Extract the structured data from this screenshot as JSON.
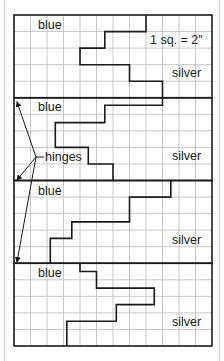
{
  "diagram": {
    "scale_label": "1 sq. = 2″",
    "hinges_label": "hinges",
    "grid": {
      "columns": 12,
      "rows": 20,
      "rows_per_panel": 5,
      "origin_x": 14,
      "origin_y": 15,
      "cell_w": 16.5,
      "cell_h": 16.55
    },
    "colors": {
      "grid": "#c8c8c8",
      "outline": "#1a1a1a",
      "frame": "#d4d4d4"
    },
    "panels": [
      {
        "top_label": "blue",
        "bottom_label": "silver",
        "path": [
          [
            8,
            0
          ],
          [
            8,
            1
          ],
          [
            5.5,
            1
          ],
          [
            5.5,
            2
          ],
          [
            4,
            2
          ],
          [
            4,
            3
          ],
          [
            7,
            3
          ],
          [
            7,
            4
          ],
          [
            9,
            4
          ],
          [
            9,
            5
          ]
        ]
      },
      {
        "top_label": "blue",
        "bottom_label": "silver",
        "path": [
          [
            9,
            5
          ],
          [
            9,
            5.45
          ],
          [
            5.5,
            5.45
          ],
          [
            5.5,
            6.5
          ],
          [
            2.5,
            6.5
          ],
          [
            2.5,
            8
          ],
          [
            4.5,
            8
          ],
          [
            4.5,
            9
          ],
          [
            6,
            9
          ],
          [
            6,
            10
          ]
        ]
      },
      {
        "top_label": "blue",
        "bottom_label": "silver",
        "path": [
          [
            9.5,
            10
          ],
          [
            9.5,
            11
          ],
          [
            7,
            11
          ],
          [
            7,
            12.5
          ],
          [
            3.5,
            12.5
          ],
          [
            3.5,
            13.5
          ],
          [
            2.2,
            13.5
          ],
          [
            2.2,
            15
          ]
        ]
      },
      {
        "top_label": "blue",
        "bottom_label": "silver",
        "path": [
          [
            4,
            15
          ],
          [
            4,
            15.5
          ],
          [
            5,
            15.5
          ],
          [
            5,
            16.5
          ],
          [
            8.5,
            16.5
          ],
          [
            8.5,
            17.5
          ],
          [
            6.2,
            17.5
          ],
          [
            6.2,
            18.5
          ],
          [
            3.2,
            18.5
          ],
          [
            3.2,
            20
          ]
        ]
      }
    ],
    "hinge_arrows": [
      {
        "from": [
          36,
          157
        ],
        "to": [
          17,
          102
        ]
      },
      {
        "from": [
          36,
          157
        ],
        "to": [
          17,
          180
        ]
      },
      {
        "from": [
          36,
          157
        ],
        "to": [
          17,
          262
        ]
      }
    ]
  }
}
